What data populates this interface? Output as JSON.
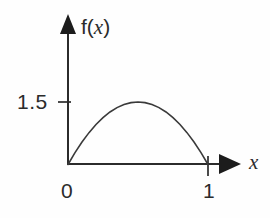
{
  "figure": {
    "name": "probability-density-plot",
    "background_color": "#fefefe",
    "ink_color": "#2b2b2b",
    "axis_labels": {
      "y_axis_label_prefix": "f(",
      "y_axis_label_variable": "x",
      "y_axis_label_suffix": ")",
      "x_axis_label": "x"
    },
    "ticks": {
      "y": [
        "1.5"
      ],
      "x": [
        "0",
        "1"
      ]
    }
  },
  "chart_data": {
    "type": "line",
    "title": "",
    "subtitle": "",
    "xlabel": "x",
    "ylabel": "f(x)",
    "xlim": [
      0,
      1
    ],
    "ylim": [
      0,
      1.75
    ],
    "grid": false,
    "legend": false,
    "legend_position": "none",
    "xticks": [
      0,
      1
    ],
    "xticklabels": [
      "0",
      "1"
    ],
    "yticks": [
      1.5
    ],
    "yticklabels": [
      "1.5"
    ],
    "annotations": [],
    "series": [
      {
        "name": "f(x)",
        "color": "#3a3a3a",
        "x": [
          0.0,
          0.05,
          0.1,
          0.15,
          0.2,
          0.25,
          0.3,
          0.35,
          0.4,
          0.45,
          0.5,
          0.55,
          0.6,
          0.65,
          0.7,
          0.75,
          0.8,
          0.85,
          0.9,
          0.95,
          1.0
        ],
        "y": [
          0.0,
          0.285,
          0.54,
          0.765,
          0.96,
          1.125,
          1.26,
          1.365,
          1.44,
          1.485,
          1.5,
          1.485,
          1.44,
          1.365,
          1.26,
          1.125,
          0.96,
          0.765,
          0.54,
          0.285,
          0.0
        ]
      }
    ]
  }
}
